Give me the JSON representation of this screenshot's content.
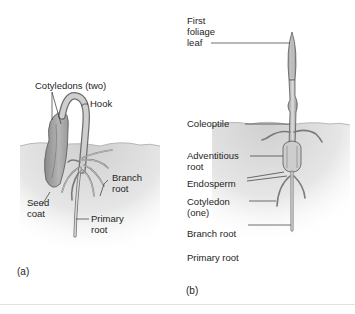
{
  "figure": {
    "panels": [
      {
        "id": "a",
        "label": "(a)",
        "labels": {
          "cotyledons": "Cotyledons (two)",
          "hook": "Hook",
          "branch_root_1": "Branch",
          "branch_root_2": "root",
          "seed_coat_1": "Seed",
          "seed_coat_2": "coat",
          "primary_root_1": "Primary",
          "primary_root_2": "root"
        }
      },
      {
        "id": "b",
        "label": "(b)",
        "labels": {
          "first_foliage_leaf_1": "First",
          "first_foliage_leaf_2": "foliage",
          "first_foliage_leaf_3": "leaf",
          "coleoptile": "Coleoptile",
          "adventitious_root_1": "Adventitious",
          "adventitious_root_2": "root",
          "endosperm": "Endosperm",
          "cotyledon_1": "Cotyledon",
          "cotyledon_2": "(one)",
          "branch_root": "Branch root",
          "primary_root": "Primary root"
        }
      }
    ],
    "colors": {
      "soil": "#d8d8d8",
      "plant_fill": "#bdbdbd",
      "plant_stroke": "#6d6d6d",
      "leader_line": "#333333"
    }
  }
}
